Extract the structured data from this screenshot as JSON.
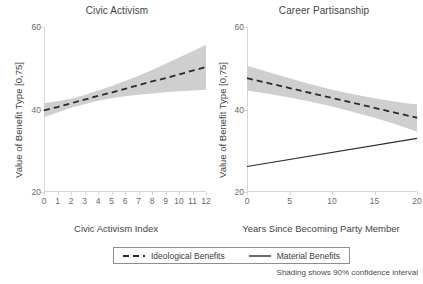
{
  "chart_data": {
    "type": "line",
    "title": "",
    "ylabel": "Value of Benefit Type [0,75]",
    "ylim": [
      20,
      60
    ],
    "yticks": [
      20,
      40,
      60
    ],
    "grid": false,
    "legend_position": "bottom",
    "footnote": "Shading shows 90% confidence interval",
    "panels": [
      {
        "title": "Civic Activism",
        "xlabel": "Civic Activism Index",
        "ylabel": "Value of Benefit Type [0,75]",
        "xlim": [
          0,
          12
        ],
        "xticks": [
          0,
          1,
          2,
          3,
          4,
          5,
          6,
          7,
          8,
          9,
          10,
          11,
          12
        ],
        "ylim": [
          20,
          60
        ],
        "yticks": [
          20,
          40,
          60
        ],
        "series": [
          {
            "name": "Ideological Benefits",
            "style": "dashed",
            "x": [
              0,
              1,
              2,
              3,
              4,
              5,
              6,
              7,
              8,
              9,
              10,
              11,
              12
            ],
            "values": [
              39.8,
              40.6,
              41.5,
              42.4,
              43.3,
              44.1,
              45.0,
              45.9,
              46.8,
              47.6,
              48.5,
              49.4,
              50.3
            ],
            "ci_lower": [
              38.1,
              39.3,
              40.4,
              41.3,
              42.1,
              42.7,
              43.2,
              43.6,
              43.9,
              44.2,
              44.4,
              44.6,
              44.8
            ],
            "ci_upper": [
              41.5,
              42.0,
              42.6,
              43.5,
              44.6,
              45.7,
              46.9,
              48.2,
              49.6,
              51.1,
              52.6,
              54.1,
              55.7
            ]
          }
        ]
      },
      {
        "title": "Career Partisanship",
        "xlabel": "Years Since Becoming Party Member",
        "ylabel": "Value of Benefit Type [0,75]",
        "xlim": [
          0,
          20
        ],
        "xticks": [
          0,
          5,
          10,
          15,
          20
        ],
        "ylim": [
          20,
          60
        ],
        "yticks": [
          20,
          40,
          60
        ],
        "series": [
          {
            "name": "Ideological Benefits",
            "style": "dashed",
            "x": [
              0,
              2.5,
              5,
              7.5,
              10,
              12.5,
              15,
              17.5,
              20
            ],
            "values": [
              47.6,
              46.4,
              45.2,
              44.0,
              42.8,
              41.6,
              40.4,
              39.2,
              38.0
            ],
            "ci_lower": [
              44.6,
              43.8,
              42.9,
              41.9,
              40.7,
              39.4,
              38.0,
              36.4,
              34.6
            ],
            "ci_upper": [
              50.6,
              49.1,
              47.6,
              46.1,
              44.8,
              43.7,
              42.7,
              41.9,
              41.2
            ]
          },
          {
            "name": "Material Benefits",
            "style": "solid",
            "x": [
              0,
              20
            ],
            "values": [
              26.2,
              33.0
            ],
            "ci_lower": [],
            "ci_upper": []
          }
        ]
      }
    ],
    "legend": [
      {
        "label": "Ideological Benefits",
        "style": "dashed"
      },
      {
        "label": "Material Benefits",
        "style": "solid"
      }
    ],
    "colors": {
      "line": "#2b2b2b",
      "band": "#cfcfcf",
      "axis": "#d6d6d6",
      "text": "#3d3d3d",
      "tick_text": "#6a6a6a",
      "background": "#ffffff"
    }
  }
}
